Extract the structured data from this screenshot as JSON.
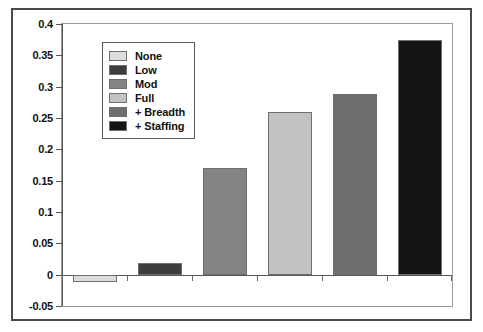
{
  "chart_data": {
    "type": "bar",
    "title": "",
    "xlabel": "",
    "ylabel": "",
    "grid": false,
    "legend_position": "upper-left-inside",
    "ylim": [
      -0.05,
      0.4
    ],
    "ytick_labels": [
      "0.4",
      "0.35",
      "0.3",
      "0.25",
      "0.2",
      "0.15",
      "0.1",
      "0.05",
      "0",
      "-0.05"
    ],
    "ytick_values": [
      0.4,
      0.35,
      0.3,
      0.25,
      0.2,
      0.15,
      0.1,
      0.05,
      0,
      -0.05
    ],
    "categories": [
      "None",
      "Low",
      "Mod",
      "Full",
      "+ Breadth",
      "+ Staffing"
    ],
    "values": [
      -0.012,
      0.018,
      0.17,
      0.259,
      0.288,
      0.375
    ],
    "series": [
      {
        "name": "",
        "values": [
          -0.012,
          0.018,
          0.17,
          0.259,
          0.288,
          0.375
        ]
      }
    ],
    "bar_colors": [
      "#dcdcdc",
      "#3d3d3d",
      "#848484",
      "#c2c2c2",
      "#6e6e6e",
      "#141414"
    ],
    "legend": [
      {
        "label": "None",
        "color": "#dcdcdc"
      },
      {
        "label": "Low",
        "color": "#3d3d3d"
      },
      {
        "label": "Mod",
        "color": "#848484"
      },
      {
        "label": "Full",
        "color": "#c2c2c2"
      },
      {
        "label": "+ Breadth",
        "color": "#6e6e6e"
      },
      {
        "label": "+ Staffing",
        "color": "#141414"
      }
    ],
    "axis_color": "#555555",
    "frame_color": "#9b9b9b",
    "outer_border_color": "#4a4a4a",
    "background": "#ffffff"
  }
}
